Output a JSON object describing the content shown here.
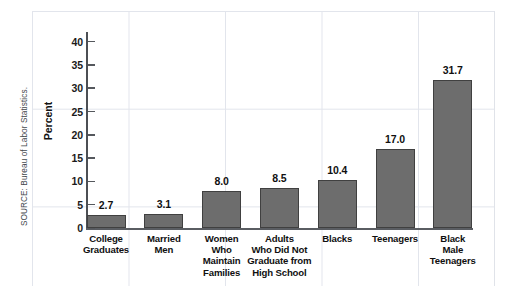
{
  "source_note": "SOURCE: Bureau of Labor Statistics.",
  "chart_data": {
    "type": "bar",
    "title": "",
    "subtitle": "",
    "xlabel": "",
    "ylabel": "Percent",
    "ylim": [
      0,
      42
    ],
    "ytick_values": [
      0,
      5,
      10,
      15,
      20,
      25,
      30,
      35,
      40
    ],
    "ytick_labels": [
      "0",
      "5",
      "10",
      "15",
      "20",
      "25",
      "30",
      "35",
      "40"
    ],
    "grid": true,
    "legend": null,
    "categories": [
      "College Graduates",
      "Married Men",
      "Women Who Maintain Families",
      "Adults Who Did Not Graduate from High School",
      "Blacks",
      "Teenagers",
      "Black Male Teenagers"
    ],
    "category_label_lines": [
      [
        "College",
        "Graduates"
      ],
      [
        "Married",
        "Men"
      ],
      [
        "Women",
        "Who",
        "Maintain",
        "Families"
      ],
      [
        "Adults",
        "Who Did Not",
        "Graduate from",
        "High School"
      ],
      [
        "Blacks"
      ],
      [
        "Teenagers"
      ],
      [
        "Black",
        "Male",
        "Teenagers"
      ]
    ],
    "values": [
      2.7,
      3.1,
      8.0,
      8.5,
      10.4,
      17.0,
      31.7
    ],
    "value_labels": [
      "2.7",
      "3.1",
      "8.0",
      "8.5",
      "10.4",
      "17.0",
      "31.7"
    ],
    "bar_color": "#6d6d6d",
    "bar_edge_color": "#404040",
    "axis_color": "#4c4f54",
    "grid_color": "#eceef2",
    "background_color": "#ffffff"
  }
}
